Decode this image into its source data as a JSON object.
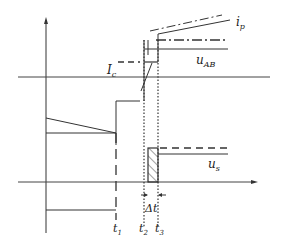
{
  "diagram": {
    "type": "waveform-timing-diagram",
    "labels": {
      "ip": {
        "main": "i",
        "sub": "p"
      },
      "uAB": {
        "main": "u",
        "sub": "AB"
      },
      "Ic": {
        "main": "I",
        "sub": "c"
      },
      "us": {
        "main": "u",
        "sub": "s"
      },
      "t1": {
        "main": "t",
        "sub": "1"
      },
      "t2": {
        "main": "t",
        "sub": "2"
      },
      "t3": {
        "main": "t",
        "sub": "3"
      },
      "dt": "Δt"
    },
    "colors": {
      "stroke": "#333333",
      "background": "#ffffff"
    }
  }
}
